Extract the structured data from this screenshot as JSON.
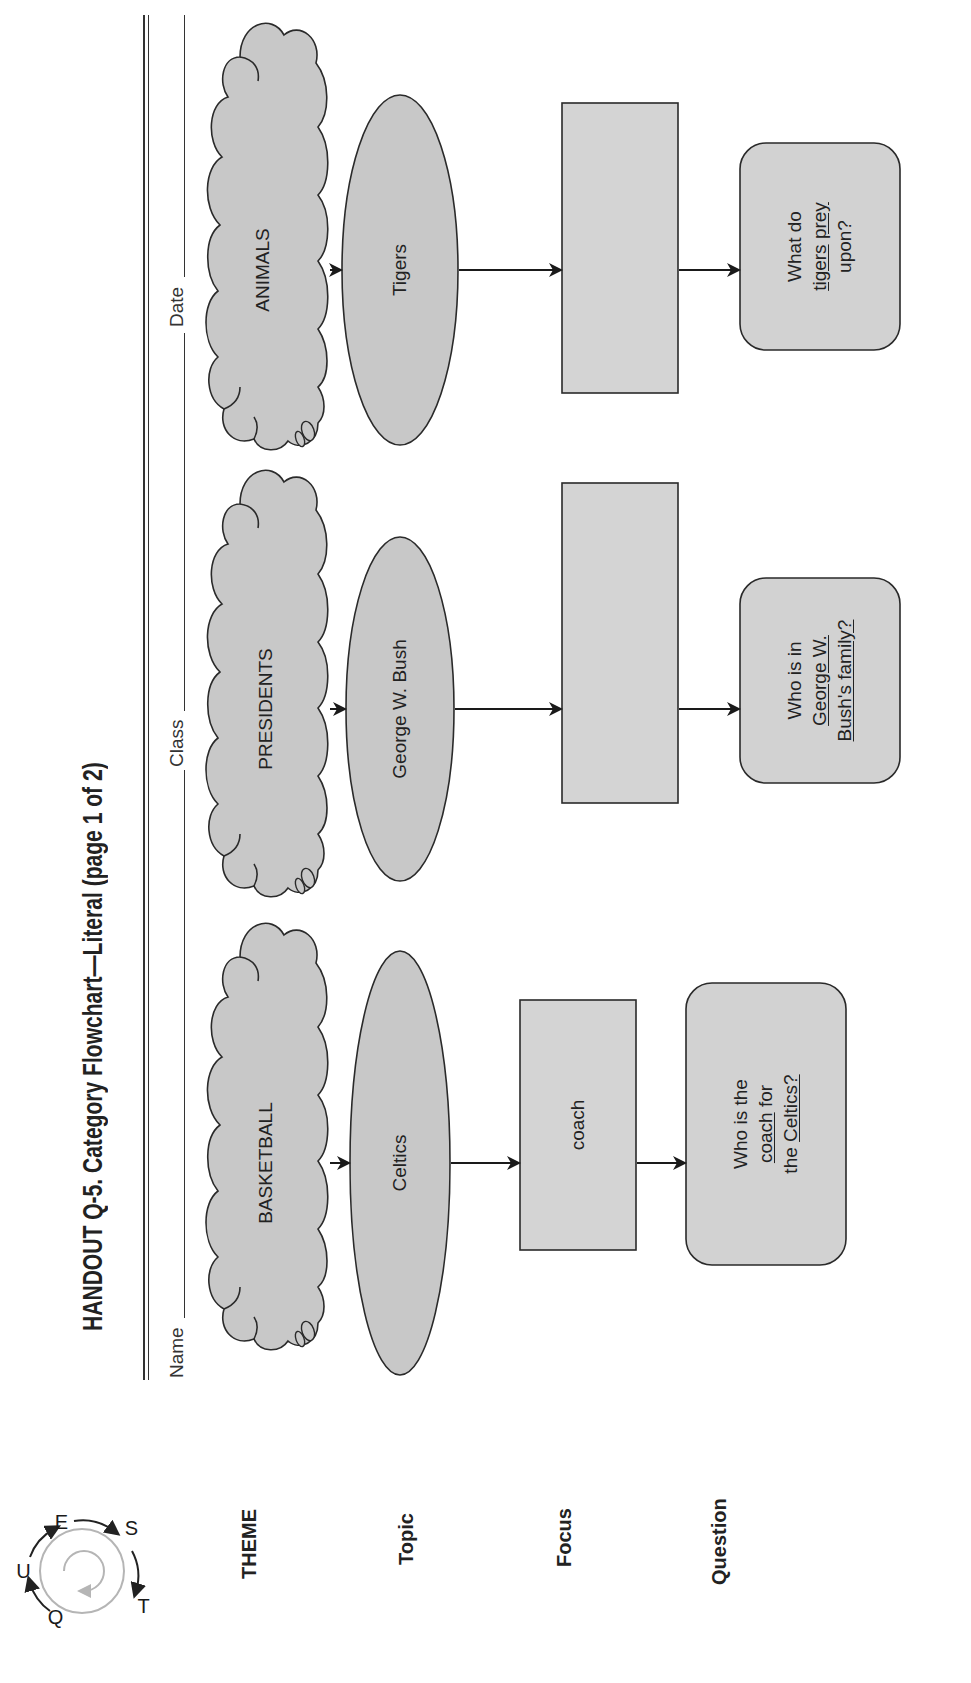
{
  "header": {
    "title": "HANDOUT Q-5.  Category Flowchart—Literal (page 1 of 2)",
    "logo": {
      "icon": "questions-cycle-logo-icon",
      "letters": [
        "Q",
        "U",
        "E",
        "S",
        "T"
      ]
    },
    "fields": {
      "name_label": "Name",
      "class_label": "Class",
      "date_label": "Date"
    }
  },
  "row_labels": {
    "theme": "THEME",
    "topic": "Topic",
    "focus": "Focus",
    "question": "Question"
  },
  "columns": [
    {
      "theme": "BASKETBALL",
      "topic": "Celtics",
      "focus": "coach",
      "question_parts": [
        {
          "line": [
            "Who is the"
          ]
        },
        {
          "line": [
            "coach",
            " for"
          ],
          "underline": [
            true,
            false
          ]
        },
        {
          "line": [
            "the ",
            "Celtics?"
          ],
          "underline": [
            false,
            true
          ]
        }
      ],
      "question": "Who is the coach for the Celtics?"
    },
    {
      "theme": "PRESIDENTS",
      "topic": "George W. Bush",
      "focus": "",
      "question": "Who is in George W. Bush's family?"
    },
    {
      "theme": "ANIMALS",
      "topic": "Tigers",
      "focus": "",
      "question": "What do tigers prey upon?"
    }
  ],
  "q_lines": {
    "c1": {
      "l1": "Who is the",
      "l2a": "coach",
      "l2b": " for",
      "l3a": "the ",
      "l3b": "Celtics?"
    },
    "c2": {
      "l1": "Who is in",
      "l2": "George W.",
      "l3a": "Bush's family?"
    },
    "c3": {
      "l1": "What do",
      "l2a": "tigers",
      "l2s": " ",
      "l2b": "prey",
      "l3": "upon?"
    }
  },
  "colors": {
    "shape_fill": "#c8c8c8",
    "focus_fill": "#d4d4d4",
    "question_fill": "#d2d2d2",
    "stroke": "#2a2a2a",
    "logo_gray": "#b5b5b5"
  }
}
